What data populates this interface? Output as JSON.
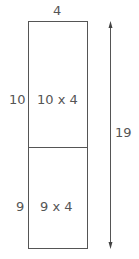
{
  "diagram": {
    "width_label": "4",
    "top_section": {
      "side_label": "10",
      "area_label": "10 x 4"
    },
    "bottom_section": {
      "side_label": "9",
      "area_label": "9 x 4"
    },
    "total_height_label": "19",
    "colors": {
      "line": "#555555",
      "background": "#ffffff"
    }
  }
}
